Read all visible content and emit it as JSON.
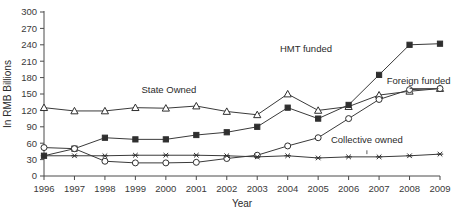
{
  "chart_data": {
    "type": "line",
    "title": "",
    "xlabel": "Year",
    "ylabel": "In RMB Billions",
    "x": [
      1996,
      1997,
      1998,
      1999,
      2000,
      2001,
      2002,
      2003,
      2004,
      2005,
      2006,
      2007,
      2008,
      2009
    ],
    "categories": [
      "1996",
      "1997",
      "1998",
      "1999",
      "2000",
      "2001",
      "2002",
      "2003",
      "2004",
      "2005",
      "2006",
      "2007",
      "2008",
      "2009"
    ],
    "xlim": [
      1996,
      2009
    ],
    "ylim": [
      0,
      300
    ],
    "yticks": [
      0,
      30,
      60,
      90,
      120,
      150,
      180,
      210,
      240,
      270,
      300
    ],
    "ytick_labels": [
      "0",
      "30",
      "60",
      "90",
      "120",
      "150",
      "180",
      "210",
      "240",
      "270",
      "300"
    ],
    "grid": false,
    "legend_position": "inline-annotations",
    "series": [
      {
        "name": "State Owned",
        "marker": "open-triangle",
        "label": "State Owned",
        "values": [
          125,
          119,
          119,
          125,
          124,
          128,
          118,
          112,
          150,
          120,
          127,
          148,
          155,
          160
        ]
      },
      {
        "name": "HMT funded",
        "marker": "filled-square",
        "label": "HMT funded",
        "values": [
          37,
          50,
          70,
          67,
          67,
          75,
          80,
          90,
          125,
          105,
          130,
          185,
          240,
          242
        ]
      },
      {
        "name": "Foreign funded",
        "marker": "open-circle",
        "label": "Foreign funded",
        "values": [
          52,
          50,
          27,
          24,
          24,
          25,
          32,
          38,
          55,
          70,
          105,
          140,
          158,
          160
        ]
      },
      {
        "name": "Collective owned",
        "marker": "asterisk",
        "label": "Collective owned",
        "values": [
          37,
          37,
          37,
          38,
          38,
          38,
          37,
          35,
          37,
          33,
          35,
          35,
          37,
          40
        ]
      }
    ],
    "annotations": [
      {
        "text": "State Owned",
        "for": "State Owned"
      },
      {
        "text": "HMT funded",
        "for": "HMT funded"
      },
      {
        "text": "Foreign funded",
        "for": "Foreign funded"
      },
      {
        "text": "Collective owned",
        "for": "Collective owned"
      }
    ],
    "colors": {
      "line": "#3a3a3a",
      "text": "#2b2b2b",
      "axis": "#4a4a4a",
      "background": "#ffffff"
    }
  }
}
